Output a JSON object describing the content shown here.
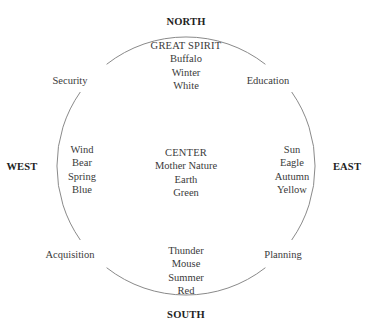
{
  "diagram": {
    "type": "medicine-wheel",
    "directions": {
      "north": "NORTH",
      "south": "SOUTH",
      "east": "EAST",
      "west": "WEST"
    },
    "corners": {
      "northwest": "Security",
      "northeast": "Education",
      "southwest": "Acquisition",
      "southeast": "Planning"
    },
    "north_quadrant": {
      "heading": "GREAT SPIRIT",
      "items": [
        "Buffalo",
        "Winter",
        "White"
      ]
    },
    "west_quadrant": {
      "items": [
        "Wind",
        "Bear",
        "Spring",
        "Blue"
      ]
    },
    "center": {
      "heading": "CENTER",
      "items": [
        "Mother Nature",
        "Earth",
        "Green"
      ]
    },
    "east_quadrant": {
      "items": [
        "Sun",
        "Eagle",
        "Autumn",
        "Yellow"
      ]
    },
    "south_quadrant": {
      "items": [
        "Thunder",
        "Mouse",
        "Summer",
        "Red"
      ]
    },
    "colors": {
      "circle_stroke": "#8a8a8a",
      "text": "#3a3a3a",
      "direction_text": "#222222"
    }
  }
}
